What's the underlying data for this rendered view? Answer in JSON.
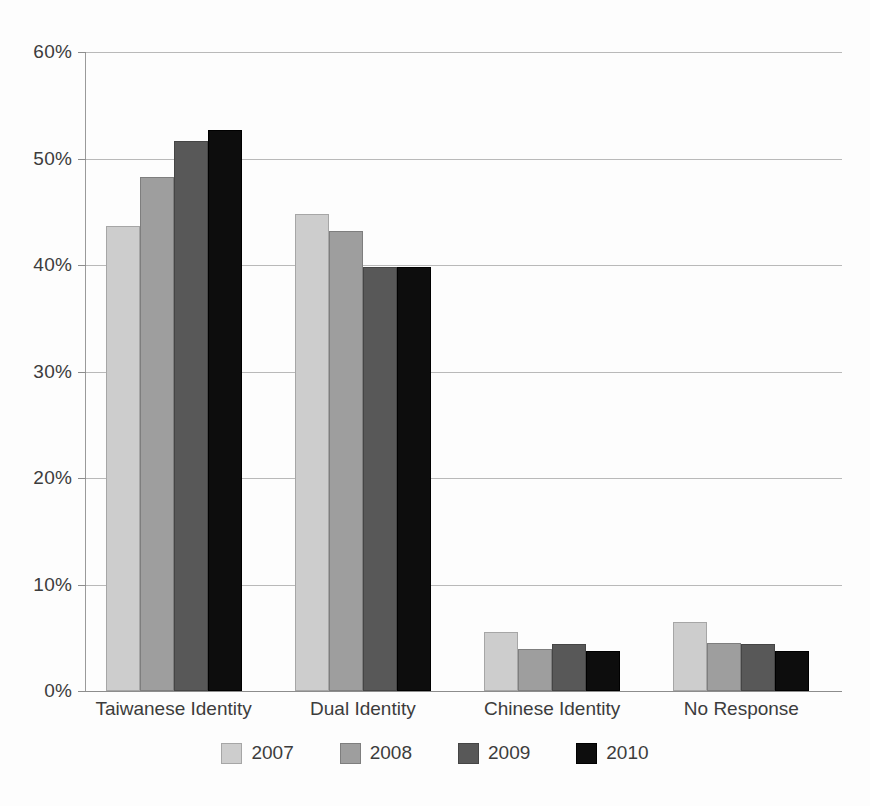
{
  "chart_data": {
    "type": "bar",
    "title": "",
    "subtitle": "",
    "xlabel": "",
    "ylabel": "",
    "ylim": [
      0,
      60
    ],
    "y_tick_labels": [
      "0%",
      "10%",
      "20%",
      "30%",
      "40%",
      "50%",
      "60%"
    ],
    "y_tick_values": [
      0,
      10,
      20,
      30,
      40,
      50,
      60
    ],
    "grid": true,
    "legend_position": "bottom",
    "categories": [
      "Taiwanese Identity",
      "Dual Identity",
      "Chinese Identity",
      "No Response"
    ],
    "series": [
      {
        "name": "2007",
        "color": "#cdcdcd",
        "values": [
          43.7,
          44.8,
          5.5,
          6.5
        ]
      },
      {
        "name": "2008",
        "color": "#9e9e9e",
        "values": [
          48.3,
          43.2,
          3.9,
          4.5
        ]
      },
      {
        "name": "2009",
        "color": "#585858",
        "values": [
          51.6,
          39.8,
          4.4,
          4.4
        ]
      },
      {
        "name": "2010",
        "color": "#0d0d0d",
        "values": [
          52.7,
          39.8,
          3.8,
          3.8
        ]
      }
    ]
  },
  "legend": {
    "entries": [
      {
        "label": "2007"
      },
      {
        "label": "2008"
      },
      {
        "label": "2009"
      },
      {
        "label": "2010"
      }
    ]
  }
}
